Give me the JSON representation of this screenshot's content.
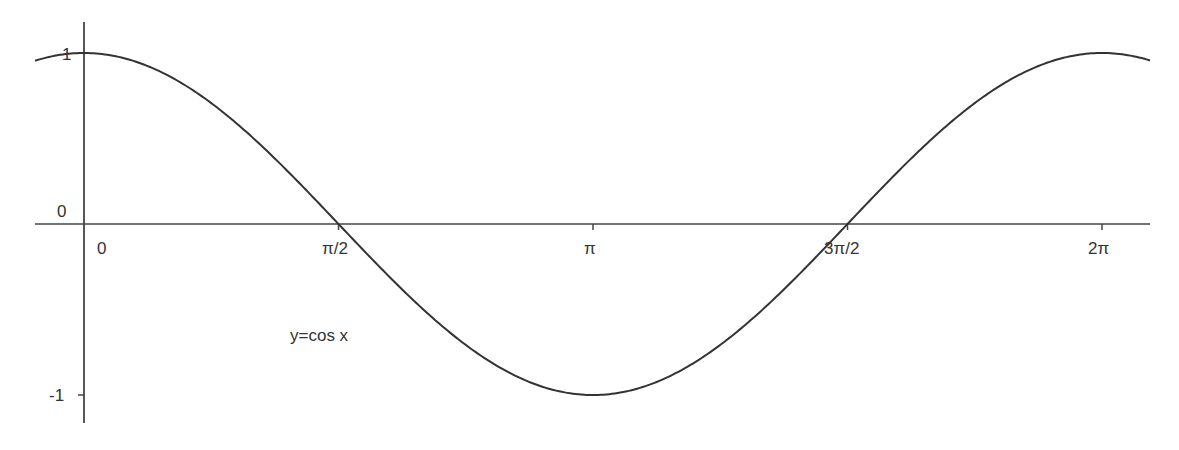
{
  "chart_data": {
    "type": "line",
    "title": "",
    "function_label": "y=cos x",
    "xlabel": "",
    "ylabel": "",
    "x_ticks": [
      {
        "label": "0",
        "value": 0
      },
      {
        "label": "π/2",
        "value": 1.5708
      },
      {
        "label": "π",
        "value": 3.1416
      },
      {
        "label": "3π/2",
        "value": 4.7124
      },
      {
        "label": "2π",
        "value": 6.2832
      }
    ],
    "y_ticks": [
      {
        "label": "1",
        "value": 1
      },
      {
        "label": "0",
        "value": 0
      },
      {
        "label": "-1",
        "value": -1
      }
    ],
    "xlim": [
      -0.3,
      6.6
    ],
    "ylim": [
      -1.15,
      1.2
    ],
    "grid": false,
    "legend": "none",
    "series": [
      {
        "name": "y=cos x",
        "x": [
          -0.3,
          0,
          0.7854,
          1.5708,
          2.3562,
          3.1416,
          3.927,
          4.7124,
          5.4978,
          6.2832,
          6.6
        ],
        "values": [
          0.955,
          1,
          0.707,
          0,
          -0.707,
          -1,
          -0.707,
          0,
          0.707,
          1,
          0.951
        ]
      }
    ]
  },
  "colors": {
    "curve": "#333333",
    "axes": "#444444",
    "text": "#333333",
    "background": "#ffffff"
  }
}
